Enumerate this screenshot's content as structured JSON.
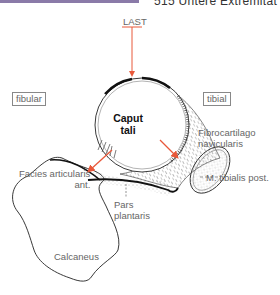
{
  "header": {
    "title": "515 Untere Extremität",
    "bar_color": "#8a7aa8"
  },
  "figure": {
    "load_label": "LAST",
    "side_labels": {
      "left": "fibular",
      "right": "tibial"
    },
    "structures": {
      "caput_line1": "Caput",
      "caput_line2": "tali",
      "fibrocartilago_line1": "Fibrocartilago",
      "fibrocartilago_line2": "navicularis",
      "facies_line1": "Facies articularis",
      "facies_line2": "ant.",
      "tendon": "M. tibialis post.",
      "pars_line1": "Pars",
      "pars_line2": "plantaris",
      "calcaneus": "Calcaneus"
    },
    "colors": {
      "arrow": "#e8583a",
      "outline": "#222222"
    }
  }
}
